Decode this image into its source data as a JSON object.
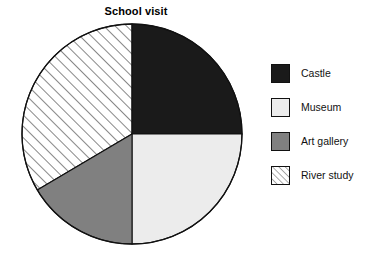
{
  "chart_data": {
    "type": "pie",
    "title": "School visit",
    "xlabel": "",
    "ylabel": "",
    "legend_position": "right",
    "grid": false,
    "start_angle_deg": 0,
    "direction": "clockwise",
    "categories": [
      "Castle",
      "Museum",
      "Art gallery",
      "River study"
    ],
    "values": [
      25,
      25,
      16.5,
      33.5
    ],
    "units": "percent",
    "slices": [
      {
        "label": "Castle",
        "value": 25,
        "start_angle_deg": 0,
        "end_angle_deg": 90,
        "fill": "#1a1a1a",
        "pattern": "solid",
        "swatch_name": "legend-swatch-castle"
      },
      {
        "label": "Museum",
        "value": 25,
        "start_angle_deg": 90,
        "end_angle_deg": 180,
        "fill": "#ececec",
        "pattern": "solid",
        "swatch_name": "legend-swatch-museum"
      },
      {
        "label": "Art gallery",
        "value": 16.5,
        "start_angle_deg": 180,
        "end_angle_deg": 239.4,
        "fill": "#808080",
        "pattern": "solid",
        "swatch_name": "legend-swatch-art-gallery"
      },
      {
        "label": "River study",
        "value": 33.5,
        "start_angle_deg": 239.4,
        "end_angle_deg": 360,
        "fill": "#ffffff",
        "pattern": "diagonal-hatch-forward",
        "swatch_name": "legend-swatch-river-study"
      }
    ]
  },
  "colors": {
    "background": "#ffffff",
    "outline": "#111111",
    "castle": "#1a1a1a",
    "museum": "#ececec",
    "art_gallery": "#808080",
    "river_study": "#ffffff",
    "hatch_line": "#555555",
    "text": "#111111"
  },
  "legend": {
    "items": [
      {
        "label": "Castle"
      },
      {
        "label": "Museum"
      },
      {
        "label": "Art gallery"
      },
      {
        "label": "River study"
      }
    ]
  }
}
